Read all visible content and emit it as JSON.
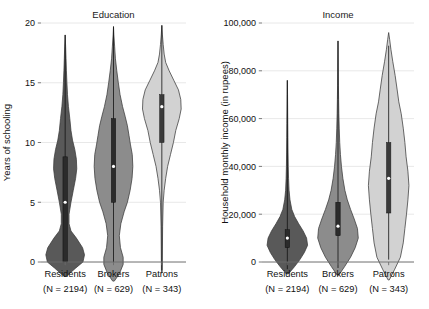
{
  "figure": {
    "type": "violin-plot-pair",
    "background": "#ffffff"
  },
  "chart_data": [
    {
      "type": "violin",
      "panel_id": "education",
      "title": "Education",
      "xlabel": "",
      "ylabel": "Years of schooling",
      "ylim": [
        0,
        20
      ],
      "yticks": [
        0,
        5,
        10,
        15,
        20
      ],
      "ytick_labels": [
        "0",
        "5",
        "10",
        "15",
        "20"
      ],
      "grid": true,
      "legend": "none",
      "categories": [
        "Residents",
        "Brokers",
        "Patrons"
      ],
      "category_sublabels": [
        "(N = 2194)",
        "(N = 629)",
        "(N = 343)"
      ],
      "n_values": [
        2194,
        629,
        343
      ],
      "series": [
        {
          "name": "Residents",
          "fill": "#595959",
          "median": 5,
          "q1": 0,
          "q3": 8.8,
          "whisker_low": 0,
          "whisker_high": 19,
          "density_min": -1.2,
          "density_max": 19,
          "density": [
            {
              "y": -1.2,
              "w": 0.06
            },
            {
              "y": -0.5,
              "w": 0.55
            },
            {
              "y": 0.0,
              "w": 0.92
            },
            {
              "y": 0.6,
              "w": 1.0
            },
            {
              "y": 1.2,
              "w": 0.9
            },
            {
              "y": 2.0,
              "w": 0.58
            },
            {
              "y": 2.6,
              "w": 0.3
            },
            {
              "y": 3.2,
              "w": 0.2
            },
            {
              "y": 4.0,
              "w": 0.2
            },
            {
              "y": 5.0,
              "w": 0.3
            },
            {
              "y": 6.0,
              "w": 0.42
            },
            {
              "y": 7.0,
              "w": 0.54
            },
            {
              "y": 7.8,
              "w": 0.6
            },
            {
              "y": 8.6,
              "w": 0.58
            },
            {
              "y": 9.4,
              "w": 0.5
            },
            {
              "y": 10.2,
              "w": 0.38
            },
            {
              "y": 11.0,
              "w": 0.3
            },
            {
              "y": 12.0,
              "w": 0.24
            },
            {
              "y": 13.0,
              "w": 0.17
            },
            {
              "y": 14.0,
              "w": 0.12
            },
            {
              "y": 15.0,
              "w": 0.09
            },
            {
              "y": 16.0,
              "w": 0.065
            },
            {
              "y": 17.0,
              "w": 0.045
            },
            {
              "y": 18.0,
              "w": 0.025
            },
            {
              "y": 19.0,
              "w": 0.0
            }
          ]
        },
        {
          "name": "Brokers",
          "fill": "#8c8c8c",
          "median": 8,
          "q1": 5,
          "q3": 12,
          "whisker_low": 0,
          "whisker_high": 19.7,
          "density_min": -1.6,
          "density_max": 19.7,
          "density": [
            {
              "y": -1.6,
              "w": 0.04
            },
            {
              "y": -1.0,
              "w": 0.3
            },
            {
              "y": -0.2,
              "w": 0.5
            },
            {
              "y": 0.4,
              "w": 0.5
            },
            {
              "y": 1.2,
              "w": 0.36
            },
            {
              "y": 2.2,
              "w": 0.3
            },
            {
              "y": 3.2,
              "w": 0.38
            },
            {
              "y": 4.2,
              "w": 0.55
            },
            {
              "y": 5.0,
              "w": 0.72
            },
            {
              "y": 6.0,
              "w": 0.86
            },
            {
              "y": 7.0,
              "w": 0.96
            },
            {
              "y": 8.0,
              "w": 1.0
            },
            {
              "y": 9.0,
              "w": 0.97
            },
            {
              "y": 9.8,
              "w": 0.88
            },
            {
              "y": 10.6,
              "w": 0.8
            },
            {
              "y": 11.4,
              "w": 0.72
            },
            {
              "y": 12.2,
              "w": 0.6
            },
            {
              "y": 13.0,
              "w": 0.47
            },
            {
              "y": 14.0,
              "w": 0.34
            },
            {
              "y": 15.0,
              "w": 0.25
            },
            {
              "y": 16.0,
              "w": 0.17
            },
            {
              "y": 17.0,
              "w": 0.1
            },
            {
              "y": 18.0,
              "w": 0.06
            },
            {
              "y": 19.0,
              "w": 0.02
            },
            {
              "y": 19.7,
              "w": 0.0
            }
          ]
        },
        {
          "name": "Patrons",
          "fill": "#d2d2d2",
          "median": 13,
          "q1": 10,
          "q3": 14,
          "whisker_low": -0.7,
          "whisker_high": 19.8,
          "density_min": -0.9,
          "density_max": 19.8,
          "density": [
            {
              "y": -0.9,
              "w": 0.02
            },
            {
              "y": 1.0,
              "w": 0.03
            },
            {
              "y": 3.0,
              "w": 0.04
            },
            {
              "y": 5.0,
              "w": 0.07
            },
            {
              "y": 6.0,
              "w": 0.12
            },
            {
              "y": 7.0,
              "w": 0.2
            },
            {
              "y": 8.0,
              "w": 0.3
            },
            {
              "y": 9.0,
              "w": 0.45
            },
            {
              "y": 10.0,
              "w": 0.6
            },
            {
              "y": 11.0,
              "w": 0.72
            },
            {
              "y": 12.0,
              "w": 0.9
            },
            {
              "y": 12.8,
              "w": 1.0
            },
            {
              "y": 13.6,
              "w": 0.98
            },
            {
              "y": 14.4,
              "w": 0.86
            },
            {
              "y": 15.2,
              "w": 0.62
            },
            {
              "y": 16.0,
              "w": 0.38
            },
            {
              "y": 16.7,
              "w": 0.2
            },
            {
              "y": 17.4,
              "w": 0.12
            },
            {
              "y": 18.2,
              "w": 0.07
            },
            {
              "y": 19.0,
              "w": 0.03
            },
            {
              "y": 19.8,
              "w": 0.0
            }
          ]
        }
      ]
    },
    {
      "type": "violin",
      "panel_id": "income",
      "title": "Income",
      "xlabel": "",
      "ylabel": "Household monthly income (in rupees)",
      "ylim": [
        0,
        100000
      ],
      "yticks": [
        0,
        20000,
        40000,
        60000,
        80000,
        100000
      ],
      "ytick_labels": [
        "0",
        "20,000",
        "40,000",
        "60,000",
        "80,000",
        "100,000"
      ],
      "grid": true,
      "legend": "none",
      "categories": [
        "Residents",
        "Brokers",
        "Patrons"
      ],
      "category_sublabels": [
        "(N = 2194)",
        "(N = 629)",
        "(N = 343)"
      ],
      "n_values": [
        2194,
        629,
        343
      ],
      "series": [
        {
          "name": "Residents",
          "fill": "#595959",
          "median": 10000,
          "q1": 6000,
          "q3": 13500,
          "whisker_low": -3000,
          "whisker_high": 76000,
          "density_min": -5000,
          "density_max": 76000,
          "density": [
            {
              "y": -5000,
              "w": 0.05
            },
            {
              "y": -2000,
              "w": 0.35
            },
            {
              "y": 1000,
              "w": 0.62
            },
            {
              "y": 4000,
              "w": 0.84
            },
            {
              "y": 7000,
              "w": 1.0
            },
            {
              "y": 10000,
              "w": 0.95
            },
            {
              "y": 13000,
              "w": 0.78
            },
            {
              "y": 16000,
              "w": 0.56
            },
            {
              "y": 19000,
              "w": 0.36
            },
            {
              "y": 22000,
              "w": 0.22
            },
            {
              "y": 26000,
              "w": 0.13
            },
            {
              "y": 30000,
              "w": 0.085
            },
            {
              "y": 35000,
              "w": 0.06
            },
            {
              "y": 40000,
              "w": 0.045
            },
            {
              "y": 46000,
              "w": 0.035
            },
            {
              "y": 52000,
              "w": 0.028
            },
            {
              "y": 58000,
              "w": 0.022
            },
            {
              "y": 64000,
              "w": 0.016
            },
            {
              "y": 70000,
              "w": 0.01
            },
            {
              "y": 76000,
              "w": 0.0
            }
          ]
        },
        {
          "name": "Brokers",
          "fill": "#8c8c8c",
          "median": 15000,
          "q1": 11000,
          "q3": 25000,
          "whisker_low": -2500,
          "whisker_high": 92500,
          "density_min": -5500,
          "density_max": 92500,
          "density": [
            {
              "y": -5500,
              "w": 0.04
            },
            {
              "y": -2000,
              "w": 0.32
            },
            {
              "y": 2000,
              "w": 0.62
            },
            {
              "y": 6000,
              "w": 0.85
            },
            {
              "y": 10000,
              "w": 1.0
            },
            {
              "y": 14000,
              "w": 0.96
            },
            {
              "y": 18000,
              "w": 0.8
            },
            {
              "y": 22000,
              "w": 0.62
            },
            {
              "y": 26000,
              "w": 0.46
            },
            {
              "y": 30000,
              "w": 0.34
            },
            {
              "y": 35000,
              "w": 0.24
            },
            {
              "y": 40000,
              "w": 0.17
            },
            {
              "y": 45000,
              "w": 0.12
            },
            {
              "y": 50000,
              "w": 0.085
            },
            {
              "y": 56000,
              "w": 0.06
            },
            {
              "y": 62000,
              "w": 0.042
            },
            {
              "y": 68000,
              "w": 0.03
            },
            {
              "y": 74000,
              "w": 0.02
            },
            {
              "y": 82000,
              "w": 0.012
            },
            {
              "y": 92500,
              "w": 0.0
            }
          ]
        },
        {
          "name": "Patrons",
          "fill": "#d2d2d2",
          "median": 35000,
          "q1": 20500,
          "q3": 50000,
          "whisker_low": 1000,
          "whisker_high": 90500,
          "density_min": -7500,
          "density_max": 96000,
          "density": [
            {
              "y": -7500,
              "w": 0.03
            },
            {
              "y": -3000,
              "w": 0.3
            },
            {
              "y": 2000,
              "w": 0.58
            },
            {
              "y": 8000,
              "w": 0.72
            },
            {
              "y": 14000,
              "w": 0.8
            },
            {
              "y": 20000,
              "w": 0.88
            },
            {
              "y": 26000,
              "w": 0.95
            },
            {
              "y": 32000,
              "w": 1.0
            },
            {
              "y": 38000,
              "w": 0.95
            },
            {
              "y": 44000,
              "w": 0.86
            },
            {
              "y": 50000,
              "w": 0.8
            },
            {
              "y": 56000,
              "w": 0.72
            },
            {
              "y": 62000,
              "w": 0.62
            },
            {
              "y": 67000,
              "w": 0.5
            },
            {
              "y": 72000,
              "w": 0.42
            },
            {
              "y": 78000,
              "w": 0.32
            },
            {
              "y": 84000,
              "w": 0.2
            },
            {
              "y": 89000,
              "w": 0.11
            },
            {
              "y": 93000,
              "w": 0.05
            },
            {
              "y": 96000,
              "w": 0.0
            }
          ]
        }
      ]
    }
  ]
}
